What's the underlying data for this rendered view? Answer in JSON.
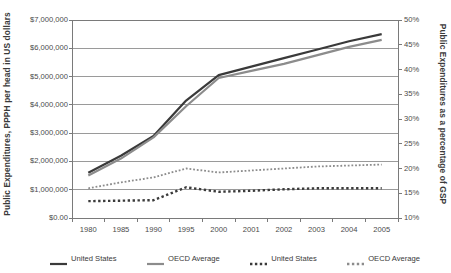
{
  "chart_data": {
    "type": "line",
    "title": "",
    "xlabel": "",
    "ylabel": "Public Expenditures, PPPH per head in US dollars",
    "y2label": "Public Expenditures as a percentage of GSP",
    "grid": true,
    "legend_position": "bottom",
    "categories": [
      "1980",
      "1985",
      "1990",
      "1995",
      "2000",
      "2001",
      "2002",
      "2003",
      "2004",
      "2005"
    ],
    "ylim": [
      0,
      7000000
    ],
    "yticks": [
      0,
      1000000,
      2000000,
      3000000,
      4000000,
      5000000,
      6000000,
      7000000
    ],
    "ytick_labels": [
      "$0.00",
      "$1,000,000",
      "$2,000,000",
      "$3,000,000",
      "$4,000,000",
      "$5,000,000",
      "$6,000,000",
      "$7,000,000"
    ],
    "y2lim": [
      10,
      50
    ],
    "y2ticks": [
      10,
      15,
      20,
      25,
      30,
      35,
      40,
      45,
      50
    ],
    "y2tick_labels": [
      "10%",
      "15%",
      "20%",
      "25%",
      "30%",
      "35%",
      "40%",
      "45%",
      "50%"
    ],
    "series": [
      {
        "name": "United States",
        "axis": "left",
        "style": "solid",
        "color": "#3a3a3a",
        "width": 2.2,
        "values": [
          1600000,
          2200000,
          2900000,
          4150000,
          5050000,
          5350000,
          5650000,
          5950000,
          6250000,
          6500000
        ]
      },
      {
        "name": "OECD Average",
        "axis": "left",
        "style": "solid",
        "color": "#8c8c8c",
        "width": 2.2,
        "values": [
          1500000,
          2100000,
          2850000,
          3950000,
          4950000,
          5200000,
          5450000,
          5750000,
          6050000,
          6300000
        ]
      },
      {
        "name": "United States",
        "axis": "right",
        "style": "dotted",
        "color": "#3a3a3a",
        "width": 2.4,
        "values": [
          13.4,
          13.5,
          13.6,
          16.2,
          15.3,
          15.5,
          15.8,
          16.0,
          16.0,
          16.0
        ]
      },
      {
        "name": "OECD Average",
        "axis": "right",
        "style": "dotted",
        "color": "#8c8c8c",
        "width": 1.8,
        "values": [
          16.0,
          17.2,
          18.2,
          20.0,
          19.2,
          19.6,
          20.0,
          20.4,
          20.6,
          20.8
        ]
      }
    ],
    "legend": [
      {
        "label": "United States",
        "style": "solid",
        "color": "#3a3a3a"
      },
      {
        "label": "OECD Average",
        "style": "solid",
        "color": "#8c8c8c"
      },
      {
        "label": "United States",
        "style": "dotted",
        "color": "#3a3a3a"
      },
      {
        "label": "OECD Average",
        "style": "dotted",
        "color": "#8c8c8c"
      }
    ],
    "colors": {
      "united_states": "#3a3a3a",
      "oecd_average": "#8c8c8c",
      "grid": "#9a9a9a",
      "frame": "#7a7a7a",
      "background": "#ffffff"
    }
  }
}
